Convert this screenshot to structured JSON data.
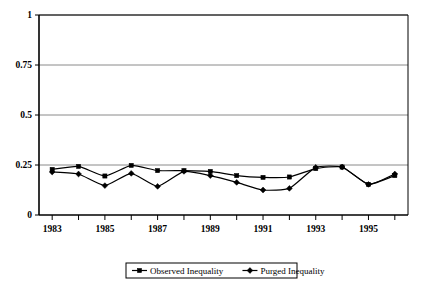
{
  "chart_data": {
    "type": "line",
    "title": "",
    "xlabel": "",
    "ylabel": "",
    "x": [
      1983,
      1984,
      1985,
      1986,
      1987,
      1988,
      1989,
      1990,
      1991,
      1992,
      1993,
      1994,
      1995,
      1996
    ],
    "xlim": [
      1982.5,
      1996.5
    ],
    "ylim": [
      0,
      1
    ],
    "yticks": [
      0,
      0.25,
      0.5,
      0.75,
      1
    ],
    "ytick_labels": [
      "0",
      "0.25",
      "0.5",
      "0.75",
      "1"
    ],
    "xtick_labels": [
      "1983",
      "",
      "1985",
      "",
      "1987",
      "",
      "1989",
      "",
      "1991",
      "",
      "1993",
      "",
      "1995",
      ""
    ],
    "xtick_visible_labels": [
      "1983",
      "1985",
      "1987",
      "1989",
      "1991",
      "1993",
      "1995"
    ],
    "grid": "horizontal",
    "legend_position": "bottom",
    "series": [
      {
        "name": "Observed Inequality",
        "marker": "square",
        "color": "#000000",
        "values": [
          0.228,
          0.243,
          0.195,
          0.248,
          0.222,
          0.222,
          0.218,
          0.197,
          0.188,
          0.19,
          0.232,
          0.24,
          0.153,
          0.197
        ]
      },
      {
        "name": "Purged Inequality",
        "marker": "diamond",
        "color": "#000000",
        "values": [
          0.215,
          0.205,
          0.147,
          0.208,
          0.143,
          0.218,
          0.197,
          0.163,
          0.125,
          0.133,
          0.238,
          0.24,
          0.153,
          0.205
        ]
      }
    ]
  },
  "legend": {
    "entries": [
      {
        "label": "Observed Inequality",
        "marker": "square"
      },
      {
        "label": "Purged Inequality",
        "marker": "diamond"
      }
    ]
  }
}
